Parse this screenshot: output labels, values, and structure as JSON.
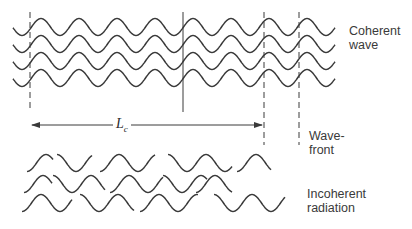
{
  "labels": {
    "coherent_line1": "Coherent",
    "coherent_line2": "wave",
    "wavefront_line1": "Wave-",
    "wavefront_line2": "front",
    "incoherent_line1": "Incoherent",
    "incoherent_line2": "radiation",
    "coherence_length_symbol": "L",
    "coherence_length_subscript": "c"
  },
  "colors": {
    "stroke": "#3a3a3a",
    "text": "#3a3a3a"
  },
  "coherent_wave": {
    "rows": 4,
    "x_start": 13,
    "x_end": 335,
    "first_center_y": 27,
    "row_spacing": 17,
    "amplitude": 8.5,
    "wavelength": 38,
    "phase_crest_x": 41
  },
  "vertical_lines": [
    {
      "x": 30,
      "y1": 12,
      "y2": 112,
      "style": "dashed"
    },
    {
      "x": 183,
      "y1": 12,
      "y2": 112,
      "style": "solid"
    },
    {
      "x": 264,
      "y1": 12,
      "y2": 145,
      "style": "dashed"
    },
    {
      "x": 299,
      "y1": 12,
      "y2": 145,
      "style": "dashed"
    }
  ],
  "coherence_arrow": {
    "x1": 30,
    "x2": 264,
    "y": 125,
    "label_x": 113,
    "label_y": 116
  },
  "incoherent_segments": [
    {
      "row": 0,
      "cy": 163,
      "segs": [
        [
          27,
          53,
          0.5
        ],
        [
          57,
          92,
          0.0
        ],
        [
          100,
          155,
          0.5
        ],
        [
          168,
          232,
          0.0
        ],
        [
          237,
          271,
          0.5
        ]
      ]
    },
    {
      "row": 1,
      "cy": 184,
      "segs": [
        [
          24,
          52,
          0.5
        ],
        [
          53,
          105,
          0.0
        ],
        [
          110,
          163,
          0.5
        ],
        [
          163,
          207,
          0.0
        ],
        [
          196,
          232,
          0.5
        ]
      ]
    },
    {
      "row": 2,
      "cy": 203,
      "segs": [
        [
          22,
          72,
          0.5
        ],
        [
          80,
          134,
          0.0
        ],
        [
          140,
          198,
          0.5
        ],
        [
          214,
          285,
          0.0
        ]
      ]
    }
  ]
}
